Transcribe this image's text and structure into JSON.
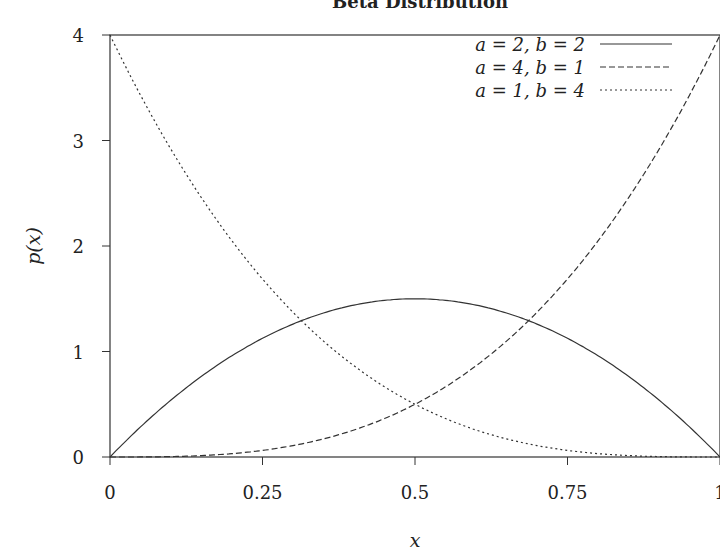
{
  "chart_data": {
    "type": "line",
    "title": "Beta Distribution",
    "xlabel": "x",
    "ylabel": "p(x)",
    "xlim": [
      0,
      1
    ],
    "ylim": [
      0,
      4
    ],
    "xticks": [
      "0",
      "0.25",
      "0.5",
      "0.75",
      "1"
    ],
    "yticks": [
      "0",
      "1",
      "2",
      "3",
      "4"
    ],
    "grid": false,
    "legend_position": "upper right",
    "series": [
      {
        "name": "a = 2, b = 2",
        "style": "solid",
        "formula": "6x(1-x)",
        "x": [
          0,
          0.1,
          0.2,
          0.3,
          0.4,
          0.5,
          0.6,
          0.7,
          0.8,
          0.9,
          1.0
        ],
        "values": [
          0,
          0.54,
          0.96,
          1.26,
          1.44,
          1.5,
          1.44,
          1.26,
          0.96,
          0.54,
          0
        ]
      },
      {
        "name": "a = 4, b = 1",
        "style": "dashed",
        "formula": "4x^3",
        "x": [
          0,
          0.1,
          0.2,
          0.3,
          0.4,
          0.5,
          0.6,
          0.7,
          0.8,
          0.9,
          1.0
        ],
        "values": [
          0,
          0.004,
          0.032,
          0.108,
          0.256,
          0.5,
          0.864,
          1.372,
          2.048,
          2.916,
          4.0
        ]
      },
      {
        "name": "a = 1, b = 4",
        "style": "dotted",
        "formula": "4(1-x)^3",
        "x": [
          0,
          0.1,
          0.2,
          0.3,
          0.4,
          0.5,
          0.6,
          0.7,
          0.8,
          0.9,
          1.0
        ],
        "values": [
          4.0,
          2.916,
          2.048,
          1.372,
          0.864,
          0.5,
          0.256,
          0.108,
          0.032,
          0.004,
          0
        ]
      }
    ]
  }
}
